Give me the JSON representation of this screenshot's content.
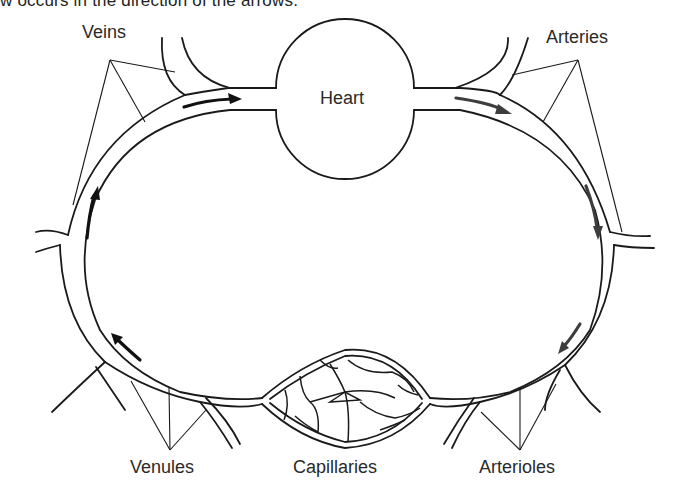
{
  "caption": "w occurs in the direction of the arrows.",
  "diagram": {
    "labels": {
      "veins": "Veins",
      "heart": "Heart",
      "arteries": "Arteries",
      "venules": "Venules",
      "capillaries": "Capillaries",
      "arterioles": "Arterioles"
    },
    "flow_direction": [
      "Heart",
      "Arteries",
      "Arterioles",
      "Capillaries",
      "Venules",
      "Veins",
      "Heart"
    ],
    "colors": {
      "stroke": "#1a1a1a",
      "arrow_dark": "#111111",
      "arrow_gray": "#3d3d3d",
      "background": "#ffffff"
    }
  }
}
